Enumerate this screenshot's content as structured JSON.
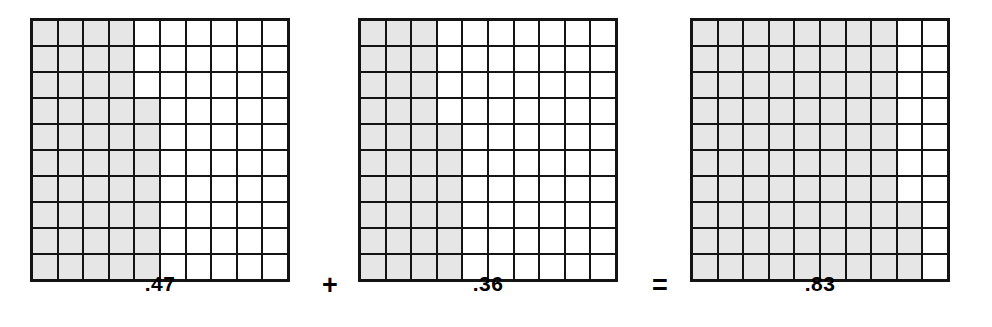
{
  "figure": {
    "kind": "decimal-grid-addition",
    "equation": ".47 + .36 = .83",
    "grid_rows": 10,
    "grid_cols": 10,
    "colors": {
      "shaded": "#e6e6e6",
      "unshaded": "#ffffff",
      "gridline": "#141414",
      "text": "#000000",
      "background": "#ffffff"
    }
  },
  "grids": [
    {
      "id": "grid-1",
      "label": ".47",
      "shaded_count": 47,
      "total_cells": 100,
      "shaded_per_row": [
        4,
        4,
        4,
        5,
        5,
        5,
        5,
        5,
        5,
        5
      ]
    },
    {
      "id": "grid-2",
      "label": ".36",
      "shaded_count": 36,
      "total_cells": 100,
      "shaded_per_row": [
        3,
        3,
        3,
        3,
        4,
        4,
        4,
        4,
        4,
        4
      ]
    },
    {
      "id": "grid-3",
      "label": ".83",
      "shaded_count": 83,
      "total_cells": 100,
      "shaded_per_row": [
        8,
        8,
        8,
        8,
        8,
        8,
        8,
        9,
        9,
        9
      ]
    }
  ],
  "operators": [
    {
      "id": "op-plus",
      "symbol": "+",
      "name": "plus-sign"
    },
    {
      "id": "op-equal",
      "symbol": "=",
      "name": "equals-sign"
    }
  ],
  "chart_data": {
    "type": "bar",
    "title": ".47 + .36 = .83",
    "categories": [
      ".47",
      ".36",
      ".83"
    ],
    "values": [
      47,
      36,
      83
    ],
    "xlabel": "",
    "ylabel": "Shaded hundredths",
    "ylim": [
      0,
      100
    ],
    "grid": true,
    "legend": "none"
  }
}
